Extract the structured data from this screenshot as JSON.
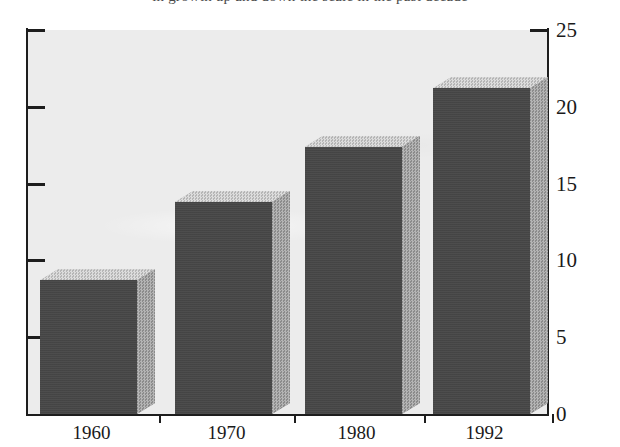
{
  "page": {
    "top_caption_sliver": "in growth up and down the scale in the past decade"
  },
  "chart_data": {
    "type": "bar",
    "title": "",
    "subtitle": "",
    "xlabel": "",
    "ylabel": "",
    "categories": [
      "1960",
      "1970",
      "1980",
      "1992"
    ],
    "values": [
      8.7,
      13.8,
      17.4,
      21.2
    ],
    "series": [
      {
        "name": "Value",
        "values": [
          8.7,
          13.8,
          17.4,
          21.2
        ]
      }
    ],
    "ylim": [
      0,
      25
    ],
    "yticks": [
      0,
      5,
      10,
      15,
      20,
      25
    ],
    "ytick_labels": [
      "0",
      "5",
      "10",
      "15",
      "20",
      "25"
    ],
    "ytick_labels_left": [
      "",
      "",
      "",
      "",
      "",
      ""
    ],
    "y_axis_position": "right",
    "grid": false,
    "legend": null,
    "style_3d": true,
    "annotations": [],
    "colors": {
      "bar_front": "#474747",
      "bar_side": "#9d9d9d",
      "bar_top": "#c9c9c9",
      "plot_background": "#ececec",
      "axis": "#1d1d1d",
      "text": "#1a1a1a",
      "page_background": "#ffffff"
    }
  }
}
